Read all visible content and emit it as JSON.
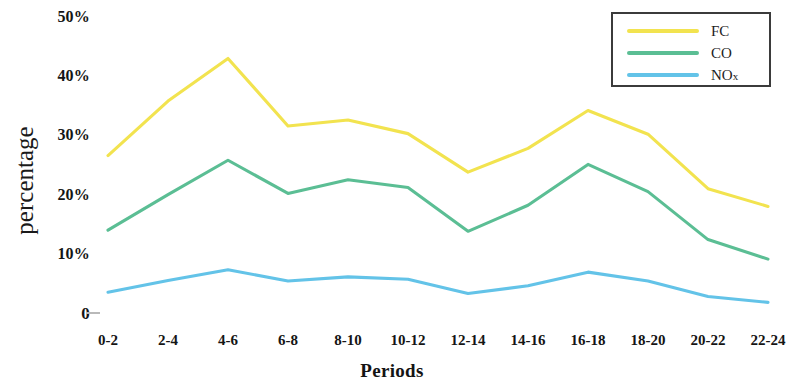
{
  "chart_data": {
    "type": "line",
    "title": "",
    "xlabel": "Periods",
    "ylabel": "percentage",
    "categories": [
      "0-2",
      "2-4",
      "4-6",
      "6-8",
      "8-10",
      "10-12",
      "12-14",
      "14-16",
      "16-18",
      "18-20",
      "20-22",
      "22-24"
    ],
    "ylim": [
      0,
      50
    ],
    "yticks": [
      0,
      10,
      20,
      30,
      40,
      50
    ],
    "ytick_labels": [
      "0",
      "10%",
      "20%",
      "30%",
      "40%",
      "50%"
    ],
    "grid": false,
    "legend_position": "top-right",
    "series": [
      {
        "name": "FC",
        "color": "#F2E34F",
        "values": [
          26.6,
          35.8,
          43.0,
          31.6,
          32.6,
          30.3,
          23.8,
          27.8,
          34.2,
          30.2,
          21.0,
          18.0
        ]
      },
      {
        "name": "CO",
        "color": "#5BBE94",
        "values": [
          14.0,
          20.0,
          25.8,
          20.2,
          22.5,
          21.2,
          13.8,
          18.2,
          25.1,
          20.5,
          12.4,
          9.1
        ]
      },
      {
        "name": "NOx",
        "color": "#63C3E8",
        "values": [
          3.5,
          5.5,
          7.3,
          5.4,
          6.1,
          5.7,
          3.3,
          4.6,
          6.9,
          5.4,
          2.8,
          1.8
        ]
      }
    ]
  },
  "legend": {
    "items": [
      {
        "label": "FC",
        "color": "#F2E34F"
      },
      {
        "label": "CO",
        "color": "#5BBE94"
      },
      {
        "label": "NOx",
        "color": "#63C3E8"
      }
    ]
  },
  "axes": {
    "y_title": "percentage",
    "x_title": "Periods"
  }
}
